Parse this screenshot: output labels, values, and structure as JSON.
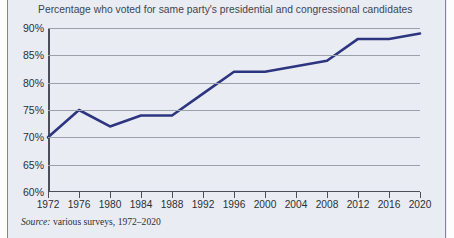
{
  "figure": {
    "title": "Percentage who voted for same party's presidential and congressional candidates",
    "source_label": "Source:",
    "source_text": " various surveys, 1972–2020"
  },
  "style": {
    "line_color": "#2e3580",
    "background": "#e9edf3",
    "gridline_color": "#9aa1ab",
    "axis_color": "#4a4f58",
    "edge_rule_color": "#d9606a"
  },
  "chart_data": {
    "type": "line",
    "title": "Percentage who voted for same party's presidential and congressional candidates",
    "xlabel": "",
    "ylabel": "",
    "xlim": [
      1972,
      2020
    ],
    "ylim": [
      60,
      90
    ],
    "grid": true,
    "legend": "none",
    "categories": [
      1972,
      1976,
      1980,
      1984,
      1988,
      1992,
      1996,
      2000,
      2004,
      2008,
      2012,
      2016,
      2020
    ],
    "x_tick_labels": [
      "1972",
      "1976",
      "1980",
      "1984",
      "1988",
      "1992",
      "1996",
      "2000",
      "2004",
      "2008",
      "2012",
      "2016",
      "2020"
    ],
    "y_tick_labels": [
      "60%",
      "65%",
      "70%",
      "75%",
      "80%",
      "85%",
      "90%"
    ],
    "y_ticks": [
      60,
      65,
      70,
      75,
      80,
      85,
      90
    ],
    "series": [
      {
        "name": "Percentage who voted for same party's presidential and congressional candidates",
        "values": [
          70,
          75,
          72,
          74,
          74,
          78,
          82,
          82,
          83,
          84,
          88,
          88,
          89
        ]
      }
    ]
  }
}
